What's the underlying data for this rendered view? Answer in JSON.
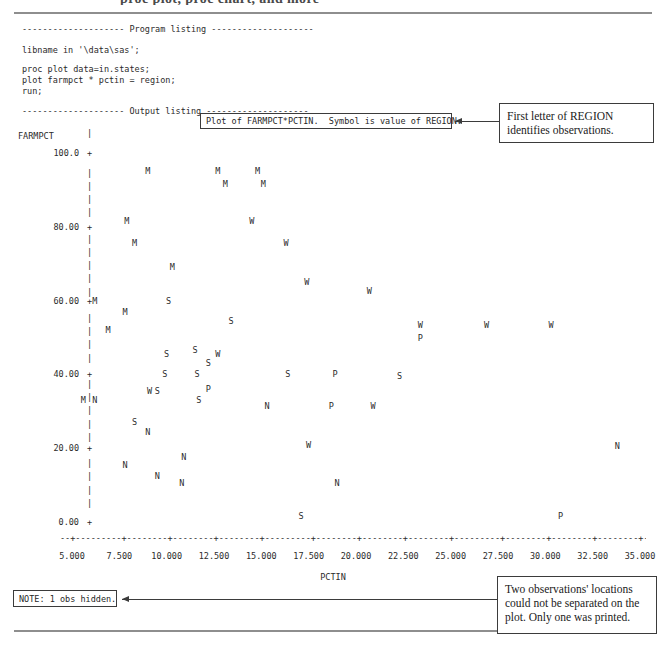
{
  "page": {
    "clipped_header": "proc plot, proc chart, and more"
  },
  "program_listing": {
    "banner": "-------------------- Program listing --------------------",
    "lines": [
      "libname in '\\data\\sas';",
      "proc plot data=in.states;",
      "plot farmpct * pctin = region;",
      "run;"
    ],
    "output_banner": "-------------------- Output listing --------------------"
  },
  "plot_title": "Plot of FARMPCT*PCTIN.  Symbol is value of REGION.",
  "note": "NOTE: 1 obs hidden.",
  "callouts": {
    "region": "First letter of REGION identifies observations.",
    "hidden": "Two observations' locations could not be separated on the plot. Only one was printed."
  },
  "chart_data": {
    "type": "scatter",
    "title": "Plot of FARMPCT*PCTIN.  Symbol is value of REGION.",
    "xlabel": "PCTIN",
    "ylabel": "FARMPCT",
    "xlim": [
      4.0,
      36.0
    ],
    "ylim": [
      0,
      100
    ],
    "grid": false,
    "legend": "none",
    "x_ticks": [
      "5.000",
      "7.500",
      "10.000",
      "12.500",
      "15.000",
      "17.500",
      "20.000",
      "22.500",
      "25.000",
      "27.500",
      "30.000",
      "32.500",
      "35.000"
    ],
    "x_tick_values": [
      5,
      7.5,
      10,
      12.5,
      15,
      17.5,
      20,
      22.5,
      25,
      27.5,
      30,
      32.5,
      35
    ],
    "y_ticks": [
      "100.0",
      "80.00",
      "60.00",
      "40.00",
      "20.00",
      "0.00"
    ],
    "y_tick_values": [
      100,
      80,
      60,
      40,
      20,
      0
    ],
    "symbol_meaning": "First letter of REGION identifies observations",
    "symbols": [
      "M",
      "N",
      "S",
      "W",
      "P"
    ],
    "points": [
      {
        "label": "M",
        "x": 9.0,
        "y": 95.0
      },
      {
        "label": "M",
        "x": 12.7,
        "y": 95.0
      },
      {
        "label": "M",
        "x": 14.8,
        "y": 95.0
      },
      {
        "label": "M",
        "x": 13.1,
        "y": 91.5
      },
      {
        "label": "M",
        "x": 15.1,
        "y": 91.5
      },
      {
        "label": "M",
        "x": 7.9,
        "y": 81.5
      },
      {
        "label": "W",
        "x": 14.5,
        "y": 81.5
      },
      {
        "label": "M",
        "x": 8.3,
        "y": 75.5
      },
      {
        "label": "W",
        "x": 16.3,
        "y": 75.5
      },
      {
        "label": "M",
        "x": 10.3,
        "y": 69.0
      },
      {
        "label": "W",
        "x": 17.4,
        "y": 65.0
      },
      {
        "label": "M",
        "x": 6.2,
        "y": 60.0
      },
      {
        "label": "S",
        "x": 10.1,
        "y": 60.0
      },
      {
        "label": "W",
        "x": 20.7,
        "y": 62.5
      },
      {
        "label": "M",
        "x": 7.8,
        "y": 57.0
      },
      {
        "label": "S",
        "x": 13.4,
        "y": 54.5
      },
      {
        "label": "W",
        "x": 23.4,
        "y": 53.5
      },
      {
        "label": "W",
        "x": 26.9,
        "y": 53.5
      },
      {
        "label": "W",
        "x": 30.3,
        "y": 53.5
      },
      {
        "label": "M",
        "x": 6.9,
        "y": 52.0
      },
      {
        "label": "P",
        "x": 23.4,
        "y": 50.0
      },
      {
        "label": "S",
        "x": 10.0,
        "y": 45.5
      },
      {
        "label": "S",
        "x": 11.5,
        "y": 46.5
      },
      {
        "label": "W",
        "x": 12.7,
        "y": 45.5
      },
      {
        "label": "S",
        "x": 12.2,
        "y": 43.0
      },
      {
        "label": "S",
        "x": 9.9,
        "y": 40.0
      },
      {
        "label": "S",
        "x": 11.6,
        "y": 40.0
      },
      {
        "label": "S",
        "x": 16.4,
        "y": 40.0
      },
      {
        "label": "P",
        "x": 18.9,
        "y": 40.0
      },
      {
        "label": "S",
        "x": 22.3,
        "y": 39.5
      },
      {
        "label": "W",
        "x": 9.1,
        "y": 35.5
      },
      {
        "label": "S",
        "x": 9.5,
        "y": 35.5
      },
      {
        "label": "P",
        "x": 12.2,
        "y": 36.0
      },
      {
        "label": "M",
        "x": 5.6,
        "y": 33.0
      },
      {
        "label": "N",
        "x": 6.2,
        "y": 33.0
      },
      {
        "label": "S",
        "x": 11.7,
        "y": 33.0
      },
      {
        "label": "N",
        "x": 15.3,
        "y": 31.5
      },
      {
        "label": "P",
        "x": 18.7,
        "y": 31.5
      },
      {
        "label": "W",
        "x": 20.9,
        "y": 31.5
      },
      {
        "label": "S",
        "x": 8.3,
        "y": 27.0
      },
      {
        "label": "N",
        "x": 9.0,
        "y": 24.5
      },
      {
        "label": "W",
        "x": 17.5,
        "y": 21.0
      },
      {
        "label": "N",
        "x": 10.9,
        "y": 17.5
      },
      {
        "label": "N",
        "x": 7.8,
        "y": 15.5
      },
      {
        "label": "N",
        "x": 9.5,
        "y": 12.5
      },
      {
        "label": "N",
        "x": 10.8,
        "y": 10.5
      },
      {
        "label": "N",
        "x": 19.0,
        "y": 10.5
      },
      {
        "label": "N",
        "x": 33.8,
        "y": 20.5
      },
      {
        "label": "S",
        "x": 17.1,
        "y": 1.5
      },
      {
        "label": "P",
        "x": 30.8,
        "y": 1.5
      }
    ]
  }
}
